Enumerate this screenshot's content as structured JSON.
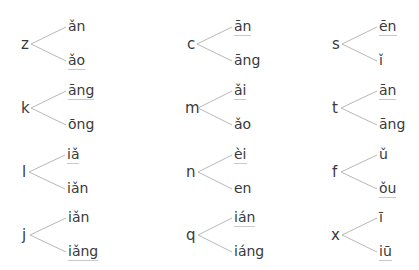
{
  "groups": [
    {
      "initial": "z",
      "top": "ǎn",
      "bottom": "ǎo",
      "marked": "bottom",
      "x": 21,
      "y": 16
    },
    {
      "initial": "c",
      "top": "ān",
      "bottom": "āng",
      "marked": "top",
      "x": 187,
      "y": 16
    },
    {
      "initial": "s",
      "top": "ēn",
      "bottom": "ǐ",
      "marked": "top",
      "x": 332,
      "y": 16
    },
    {
      "initial": "k",
      "top": "āng",
      "bottom": "ōng",
      "marked": "top",
      "x": 21,
      "y": 80
    },
    {
      "initial": "m",
      "top": "ǎi",
      "bottom": "ǎo",
      "marked": "top",
      "x": 185,
      "y": 80
    },
    {
      "initial": "t",
      "top": "ān",
      "bottom": "āng",
      "marked": "top",
      "x": 332,
      "y": 80
    },
    {
      "initial": "l",
      "top": "iǎ",
      "bottom": "iǎn",
      "marked": "top",
      "x": 22,
      "y": 144
    },
    {
      "initial": "n",
      "top": "èi",
      "bottom": "en",
      "marked": "top",
      "x": 186,
      "y": 144
    },
    {
      "initial": "f",
      "top": "ǔ",
      "bottom": "ǒu",
      "marked": "bottom",
      "x": 332,
      "y": 144
    },
    {
      "initial": "j",
      "top": "iǎn",
      "bottom": "iǎng",
      "marked": "bottom",
      "x": 22,
      "y": 207
    },
    {
      "initial": "q",
      "top": "ián",
      "bottom": "iáng",
      "marked": "top",
      "x": 186,
      "y": 207
    },
    {
      "initial": "x",
      "top": "ī",
      "bottom": "iū",
      "marked": "bottom",
      "x": 331,
      "y": 207
    }
  ],
  "colors": {
    "text": "#3a3a3a",
    "line": "#b8b8b8",
    "underline": "#c9c9c9"
  }
}
